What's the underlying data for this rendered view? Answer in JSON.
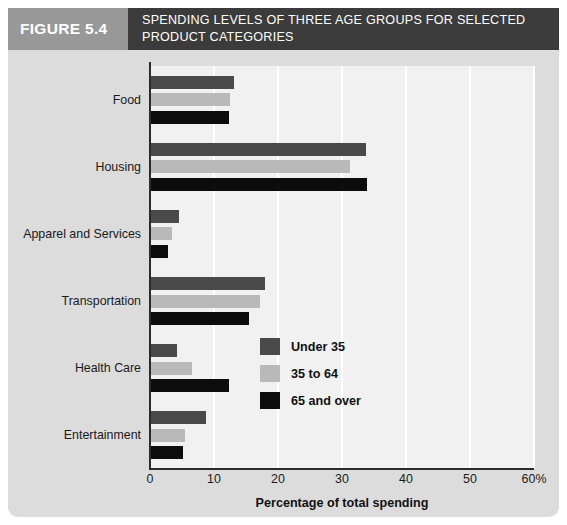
{
  "header": {
    "figure_number": "FIGURE 5.4",
    "figure_title": "SPENDING LEVELS OF THREE AGE GROUPS FOR SELECTED PRODUCT CATEGORIES"
  },
  "colors": {
    "series_under_35": "#4a4a4a",
    "series_35_to_64": "#b9b9b9",
    "series_65_and_over": "#0c0c0c",
    "header_number_bg": "#989898",
    "header_title_bg": "#3b3b3b",
    "panel_bg": "#dcdcdc",
    "plot_bg": "#f1f1f1",
    "gridline": "#ffffff",
    "axis": "#2b2b2b"
  },
  "chart_data": {
    "type": "bar",
    "orientation": "horizontal",
    "title": "SPENDING LEVELS OF THREE AGE GROUPS FOR SELECTED PRODUCT CATEGORIES",
    "xlabel": "Percentage of total spending",
    "ylabel": "",
    "categories": [
      "Food",
      "Housing",
      "Apparel and Services",
      "Transportation",
      "Health Care",
      "Entertainment"
    ],
    "series": [
      {
        "name": "Under 35",
        "color": "#4a4a4a",
        "values": [
          13.2,
          33.8,
          4.5,
          18.0,
          4.2,
          8.8
        ]
      },
      {
        "name": "35 to 64",
        "color": "#b9b9b9",
        "values": [
          12.5,
          31.2,
          3.5,
          17.2,
          6.5,
          5.4
        ]
      },
      {
        "name": "65 and over",
        "color": "#0c0c0c",
        "values": [
          12.3,
          33.9,
          2.8,
          15.5,
          12.4,
          5.1
        ]
      }
    ],
    "xlim": [
      0,
      60
    ],
    "xticks": [
      0,
      10,
      20,
      30,
      40,
      50,
      60
    ],
    "xtick_labels": [
      "0",
      "10",
      "20",
      "30",
      "40",
      "50",
      "60%"
    ],
    "grid": true,
    "grid_axis": "x",
    "legend_position": "lower-right",
    "legend_entries": [
      "Under 35",
      "35 to 64",
      "65 and over"
    ]
  }
}
